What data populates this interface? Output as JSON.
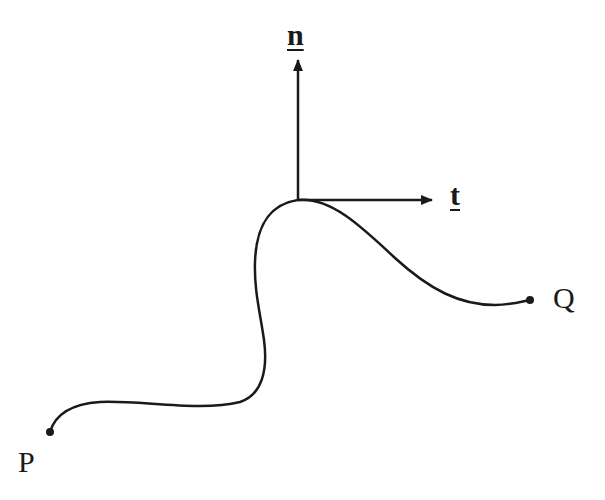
{
  "diagram": {
    "labels": {
      "normal": "n",
      "tangent": "t",
      "start_point": "P",
      "end_point": "Q"
    },
    "caption_cut": "",
    "colors": {
      "stroke": "#1a1a1a",
      "background": "#ffffff"
    },
    "geometry": {
      "origin": [
        298,
        200
      ],
      "normal_arrow_tip": [
        298,
        60
      ],
      "tangent_arrow_tip": [
        432,
        200
      ],
      "point_P": [
        50,
        432
      ],
      "point_Q": [
        530,
        300
      ]
    }
  }
}
